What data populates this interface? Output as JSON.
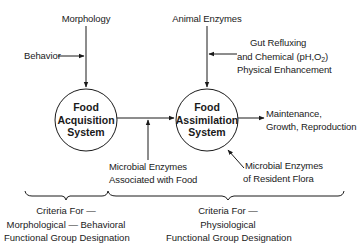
{
  "diagram": {
    "nodes": {
      "acquisition": {
        "line1": "Food",
        "line2": "Acquisition",
        "line3": "System"
      },
      "assimilation": {
        "line1": "Food",
        "line2": "Assimilation",
        "line3": "System"
      }
    },
    "inputs": {
      "morphology": "Morphology",
      "behavior": "Behavior",
      "animal_enzymes": "Animal Enzymes",
      "gut": {
        "line1": "Gut Refluxing",
        "line2_pre": "and Chemical (pH,O",
        "line2_sub": "2",
        "line2_post": ")",
        "line3": "Physical Enhancement"
      },
      "microbial_food": {
        "line1": "Microbial Enzymes",
        "line2": "Associated with Food"
      },
      "microbial_flora": {
        "line1": "Microbial Enzymes",
        "line2": "of Resident Flora"
      }
    },
    "outputs": {
      "maintenance": {
        "line1": "Maintenance,",
        "line2": "Growth, Reproduction"
      }
    },
    "criteria": {
      "left": {
        "line1": "Criteria For —",
        "line2": "Morphological — Behavioral",
        "line3": "Functional Group Designation"
      },
      "right": {
        "line1": "Criteria For —",
        "line2": "Physiological",
        "line3": "Functional Group Designation"
      }
    },
    "line_color": "#1a1a1a"
  }
}
